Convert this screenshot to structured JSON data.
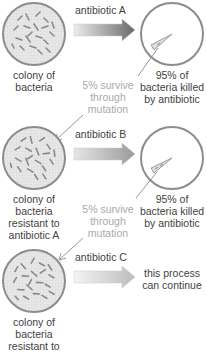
{
  "diagram": {
    "colors": {
      "circle_stroke": "#8c8c8c",
      "colony_fill": "#e4e4e4",
      "killed_fill": "#ffffff",
      "bacteria": "#8a8a8a",
      "arrow_dark": "#707070",
      "arrow_light": "#d8d8d8",
      "text": "#3f3f3f",
      "survive_text": "#a9a9a9",
      "connector": "#888888"
    },
    "stages": [
      {
        "colony_label": [
          "colony of",
          "bacteria"
        ],
        "antibiotic_label": "antibiotic A",
        "result_label": [
          "95% of",
          "bacteria killed",
          "by antibiotic"
        ],
        "survive_label": [
          "5% survive",
          "through",
          "mutation"
        ]
      },
      {
        "colony_label": [
          "colony of",
          "bacteria",
          "resistant to",
          "antibiotic A"
        ],
        "antibiotic_label": "antibiotic B",
        "result_label": [
          "95% of",
          "bacteria killed",
          "by antibiotic"
        ],
        "survive_label": [
          "5% survive",
          "through",
          "mutation"
        ]
      },
      {
        "colony_label": [
          "colony of",
          "bacteria",
          "resistant to"
        ],
        "antibiotic_label": "antibiotic C",
        "result_label": [
          "this process",
          "can continue"
        ]
      }
    ]
  }
}
